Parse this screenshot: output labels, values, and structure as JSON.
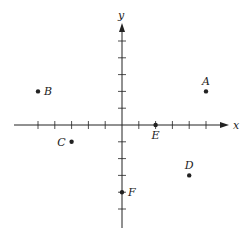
{
  "diagram": {
    "type": "coordinate-plane",
    "axes": {
      "x_label": "x",
      "y_label": "y"
    },
    "origin_px": [
      122,
      125
    ],
    "unit_px": 16.8,
    "x_ticks": [
      -5,
      -4,
      -3,
      -2,
      -1,
      1,
      2,
      3,
      4,
      5
    ],
    "y_ticks": [
      -5,
      -4,
      -3,
      -2,
      -1,
      1,
      2,
      3,
      4,
      5
    ],
    "points": [
      {
        "label": "A",
        "x": 5,
        "y": 2,
        "label_pos": "above"
      },
      {
        "label": "B",
        "x": -5,
        "y": 2,
        "label_pos": "right"
      },
      {
        "label": "C",
        "x": -3,
        "y": -1,
        "label_pos": "left"
      },
      {
        "label": "D",
        "x": 4,
        "y": -3,
        "label_pos": "above"
      },
      {
        "label": "E",
        "x": 2,
        "y": 0,
        "label_pos": "below"
      },
      {
        "label": "F",
        "x": 0,
        "y": -4,
        "label_pos": "right"
      }
    ],
    "colors": {
      "ink": "#222222",
      "background": "#ffffff"
    }
  }
}
